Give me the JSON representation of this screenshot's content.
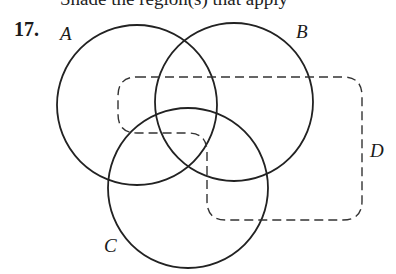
{
  "header": {
    "cropped_text": "Shade the region(s) that apply"
  },
  "problem": {
    "number": "17."
  },
  "diagram": {
    "sets": [
      {
        "label": "A",
        "shape": "circle"
      },
      {
        "label": "B",
        "shape": "circle"
      },
      {
        "label": "C",
        "shape": "circle"
      },
      {
        "label": "D",
        "shape": "dashed-rounded-region"
      }
    ],
    "labels": {
      "a": "A",
      "b": "B",
      "c": "C",
      "d": "D"
    },
    "colors": {
      "stroke": "#222222",
      "background": "#ffffff"
    }
  }
}
